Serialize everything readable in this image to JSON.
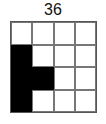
{
  "label": "36",
  "grid": {
    "rows": 4,
    "cols": 4,
    "cells": [
      [
        0,
        0,
        0,
        0
      ],
      [
        1,
        0,
        0,
        0
      ],
      [
        1,
        1,
        0,
        0
      ],
      [
        1,
        0,
        0,
        0
      ]
    ]
  },
  "colors": {
    "filled": "#000000",
    "empty": "#ffffff",
    "line": "#666666"
  }
}
